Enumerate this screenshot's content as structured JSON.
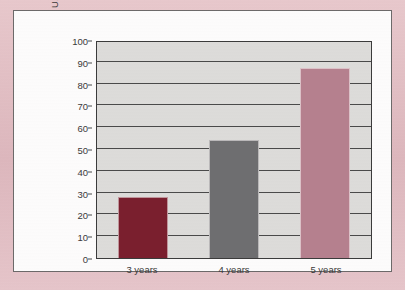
{
  "colors": {
    "frame": "#e2bfc4",
    "card": "#fdfcfc",
    "plot_background": "#dddcda",
    "axis": "#3b3b3b",
    "gridline": "#4a4a4a",
    "text": "#3a3a3a",
    "bar_3_years": "#7a1f2e",
    "bar_4_years": "#6e6e70",
    "bar_5_years": "#b5808e"
  },
  "chart_data": {
    "type": "bar",
    "title": "",
    "xlabel": "",
    "ylabel": "U.S. children enrolled in school (%)",
    "categories": [
      "3 years",
      "4 years",
      "5 years"
    ],
    "values": [
      28,
      54,
      87
    ],
    "bar_colors": [
      "#7a1f2e",
      "#6e6e70",
      "#b5808e"
    ],
    "ylim": [
      0,
      100
    ],
    "ytick_labels": [
      "0",
      "10",
      "20",
      "30",
      "40",
      "50",
      "60",
      "70",
      "80",
      "90",
      "100"
    ],
    "ytick_values": [
      0,
      10,
      20,
      30,
      40,
      50,
      60,
      70,
      80,
      90,
      100
    ],
    "ytick_step": 10,
    "grid": true,
    "grid_orientation": "horizontal",
    "legend": false,
    "legend_position": "none"
  }
}
